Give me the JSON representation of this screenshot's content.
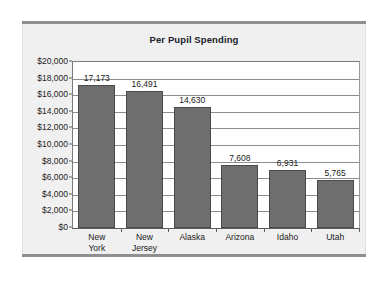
{
  "chart_data": {
    "type": "bar",
    "title": "Per Pupil Spending",
    "xlabel": "",
    "ylabel": "",
    "categories": [
      "New York",
      "New Jersey",
      "Alaska",
      "Arizona",
      "Idaho",
      "Utah"
    ],
    "category_lines": [
      [
        "New",
        "York"
      ],
      [
        "New",
        "Jersey"
      ],
      [
        "Alaska",
        ""
      ],
      [
        "Arizona",
        ""
      ],
      [
        "Idaho",
        ""
      ],
      [
        "Utah",
        ""
      ]
    ],
    "values": [
      17173,
      16491,
      14630,
      7608,
      6931,
      5765
    ],
    "value_labels": [
      "17,173",
      "16,491",
      "14,630",
      "7,608",
      "6,931",
      "5,765"
    ],
    "ylim": [
      0,
      20000
    ],
    "ytick_values": [
      0,
      2000,
      4000,
      6000,
      8000,
      10000,
      12000,
      14000,
      16000,
      18000,
      20000
    ],
    "ytick_labels": [
      "$0",
      "$2,000",
      "$4,000",
      "$6,000",
      "$8,000",
      "$10,000",
      "$12,000",
      "$14,000",
      "$16,000",
      "$18,000",
      "$20,000"
    ],
    "grid": true,
    "legend": false,
    "bar_color": "#6e6e6e",
    "bar_edge_color": "#4a4a4a",
    "plot_background": "#ffffff",
    "panel_background": "#f0f0f0",
    "gridline_color": "#8c8c8c",
    "text_color": "#1a1a20"
  }
}
